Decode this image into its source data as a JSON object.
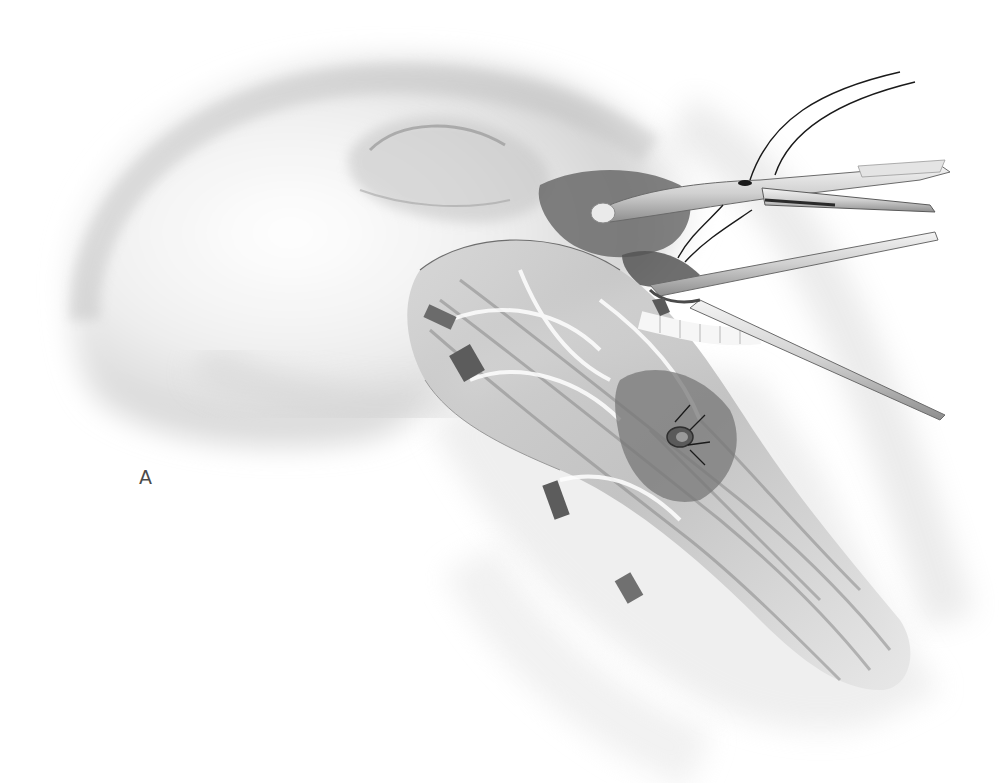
{
  "figure": {
    "label": "A",
    "style": "grayscale pencil/airbrush illustration",
    "colors": {
      "background": "#ffffff",
      "skin_light": "#e8e8e8",
      "skin_mid": "#c9c9c9",
      "shadow": "#8a8a8a",
      "dark": "#3a3a3a",
      "instrument": "#d6d6d6",
      "suture": "#1a1a1a",
      "label": "#4a4a4a"
    },
    "elements": {
      "head_outline": "head-profile",
      "dissection": "exposed-tissue-field",
      "needle_holder": "needle-holder-instrument",
      "forceps": "forceps-instrument",
      "suture": "suture-thread",
      "curved_needle": "curved-needle",
      "retraction_tapes": "vessel-loops"
    }
  }
}
